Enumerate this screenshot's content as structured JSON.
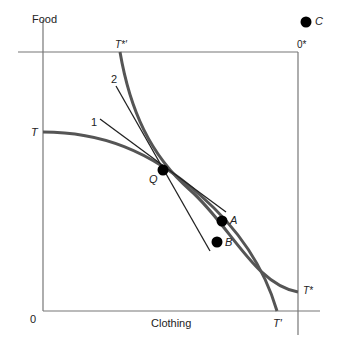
{
  "axes": {
    "y_label": "Food",
    "x_label": "Clothing",
    "origin": "0",
    "origin_star": "0*"
  },
  "curves": {
    "home_start": "T",
    "home_end": "T′",
    "foreign_start": "T*′",
    "foreign_end": "T*"
  },
  "lines": {
    "line1": "1",
    "line2": "2"
  },
  "points": {
    "Q": "Q",
    "A": "A",
    "B": "B",
    "C": "C"
  },
  "colors": {
    "curve": "#555555",
    "line": "#222222",
    "axis": "#777777"
  }
}
